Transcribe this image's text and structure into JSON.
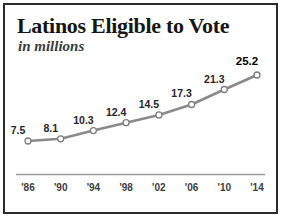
{
  "card": {
    "title": "Latinos Eligible to Vote",
    "subtitle": "in millions"
  },
  "chart_data": {
    "type": "line",
    "title": "Latinos Eligible to Vote",
    "subtitle": "in millions",
    "xlabel": "",
    "ylabel": "",
    "units": "millions",
    "grid": false,
    "legend": false,
    "categories": [
      "'86",
      "'90",
      "'94",
      "'98",
      "'02",
      "'06",
      "'10",
      "'14"
    ],
    "x": [
      1986,
      1990,
      1994,
      1998,
      2002,
      2006,
      2010,
      2014
    ],
    "values": [
      7.5,
      8.1,
      10.3,
      12.4,
      14.5,
      17.3,
      21.3,
      25.2
    ],
    "labels": [
      "7.5",
      "8.1",
      "10.3",
      "12.4",
      "14.5",
      "17.3",
      "21.3",
      "25.2"
    ],
    "highlight_index": 7,
    "ylim": [
      0,
      28
    ],
    "xlim": [
      1986,
      2014
    ],
    "series": [
      {
        "name": "Latinos eligible to vote",
        "values": [
          7.5,
          8.1,
          10.3,
          12.4,
          14.5,
          17.3,
          21.3,
          25.2
        ]
      }
    ],
    "colors": {
      "line": "#8a8a8a",
      "marker_fill": "#ffffff",
      "marker_stroke": "#7d7d7d",
      "axis": "#9a9a9a",
      "text": "#262626",
      "frame": "#2b2b2b"
    }
  }
}
